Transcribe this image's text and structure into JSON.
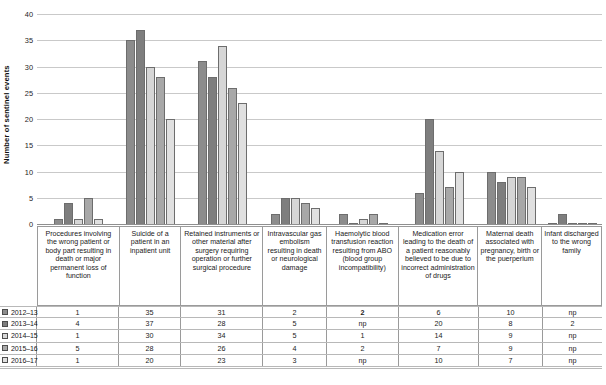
{
  "chart_data": {
    "type": "bar",
    "title": "",
    "xlabel": "",
    "ylabel": "Number of sentinel events",
    "ylim": [
      0,
      40
    ],
    "yticks": [
      0,
      5,
      10,
      15,
      20,
      25,
      30,
      35,
      40
    ],
    "grid": true,
    "legend_position": "table-left",
    "categories": [
      "Procedures involving the wrong patient or body part resulting in death or major permanent loss of function",
      "Suicide of a patient in an inpatient unit",
      "Retained instruments or other material after surgery requiring operation or further surgical procedure",
      "Intravascular gas embolism resulting in death or neurological damage",
      "Haemolytic blood transfusion reaction resulting from ABO (blood group incompatibility)",
      "Medication error leading to the death of a patient reasonably believed to be due to incorrect administration of drugs",
      "Maternal death associated with pregnancy, birth or the puerperium",
      "Infant discharged to the wrong family"
    ],
    "series": [
      {
        "name": "2012–13",
        "color": "#8c8c8c",
        "values": [
          1,
          35,
          31,
          2,
          2,
          6,
          10,
          0
        ],
        "display": [
          "1",
          "35",
          "31",
          "2",
          "2",
          "6",
          "10",
          "np"
        ]
      },
      {
        "name": "2013–14",
        "color": "#7e7e7e",
        "values": [
          4,
          37,
          28,
          5,
          0,
          20,
          8,
          2
        ],
        "display": [
          "4",
          "37",
          "28",
          "5",
          "np",
          "20",
          "8",
          "2"
        ]
      },
      {
        "name": "2014–15",
        "color": "#d6d6d6",
        "values": [
          1,
          30,
          34,
          5,
          1,
          14,
          9,
          0
        ],
        "display": [
          "1",
          "30",
          "34",
          "5",
          "1",
          "14",
          "9",
          "np"
        ]
      },
      {
        "name": "2015–16",
        "color": "#a8a8a8",
        "values": [
          5,
          28,
          26,
          4,
          2,
          7,
          9,
          0
        ],
        "display": [
          "5",
          "28",
          "26",
          "4",
          "2",
          "7",
          "9",
          "np"
        ]
      },
      {
        "name": "2016–17",
        "color": "#e0e0e0",
        "values": [
          1,
          20,
          23,
          3,
          0,
          10,
          7,
          0
        ],
        "display": [
          "1",
          "20",
          "23",
          "3",
          "np",
          "10",
          "7",
          "np"
        ]
      }
    ]
  },
  "axis": {
    "ylabel": "Number of sentinel events",
    "tick_labels": [
      "40",
      "35",
      "30",
      "25",
      "20",
      "15",
      "10",
      "5",
      "0"
    ]
  },
  "table": {
    "row_labels": [
      "2012–13",
      "2013–14",
      "2014–15",
      "2015–16",
      "2016–17"
    ],
    "rows": [
      [
        "1",
        "35",
        "31",
        "2",
        "2",
        "6",
        "10",
        "np"
      ],
      [
        "4",
        "37",
        "28",
        "5",
        "np",
        "20",
        "8",
        "2"
      ],
      [
        "1",
        "30",
        "34",
        "5",
        "1",
        "14",
        "9",
        "np"
      ],
      [
        "5",
        "28",
        "26",
        "4",
        "2",
        "7",
        "9",
        "np"
      ],
      [
        "1",
        "20",
        "23",
        "3",
        "np",
        "10",
        "7",
        "np"
      ]
    ],
    "bold_cells": [
      [
        0,
        4
      ]
    ]
  },
  "colors": {
    "grid": "#c9c9c9",
    "axis": "#8f8f8f",
    "border": "#9a9a9a",
    "text": "#1a1a1a"
  }
}
